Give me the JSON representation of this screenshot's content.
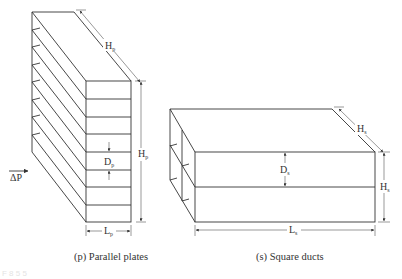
{
  "figure": {
    "panel_p": {
      "caption": "(p) Parallel plates",
      "labels": {
        "height_top": "H",
        "height_top_sub": "p",
        "height_right": "H",
        "height_right_sub": "p",
        "spacing": "D",
        "spacing_sub": "p",
        "length": "L",
        "length_sub": "p",
        "pressure": "ΔP"
      },
      "plate_count": 9
    },
    "panel_s": {
      "caption": "(s) Square ducts",
      "labels": {
        "depth": "H",
        "depth_sub": "s",
        "height_right": "H",
        "height_right_sub": "s",
        "spacing": "D",
        "spacing_sub": "s",
        "length": "L",
        "length_sub": "s"
      }
    },
    "footer_fragment": "F 8 5 5"
  },
  "colors": {
    "line": "#333333",
    "dimension": "#555555",
    "background": "#ffffff"
  }
}
